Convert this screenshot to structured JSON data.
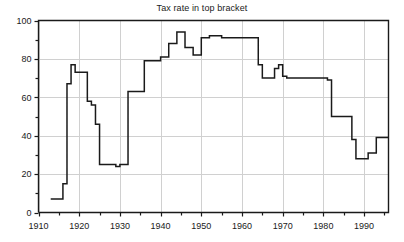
{
  "chart": {
    "title": "Tax rate in top bracket",
    "line_color": "#1a1a1a",
    "grid_color": "#d0d0d0",
    "axis_color": "#1a1a1a",
    "background": "#ffffff"
  },
  "chart_data": {
    "type": "line",
    "title": "Tax rate in top bracket",
    "xlabel": "",
    "ylabel": "",
    "xlim": [
      1910,
      1996
    ],
    "ylim": [
      0,
      100
    ],
    "grid": true,
    "legend": "none",
    "step_style": "post",
    "x_major_ticks": [
      1910,
      1920,
      1930,
      1940,
      1950,
      1960,
      1970,
      1980,
      1990
    ],
    "x_tick_labels": [
      "1910",
      "1920",
      "1930",
      "1940",
      "1950",
      "1960",
      "1970",
      "1980",
      "1990"
    ],
    "x_minor_ticks": [
      1915,
      1925,
      1935,
      1945,
      1955,
      1965,
      1975,
      1985,
      1995
    ],
    "y_major_ticks": [
      0,
      20,
      40,
      60,
      80,
      100
    ],
    "y_tick_labels": [
      "0",
      "20",
      "40",
      "60",
      "80",
      "100"
    ],
    "y_minor_ticks": [
      10,
      30,
      50,
      70,
      90
    ],
    "x": [
      1913,
      1914,
      1915,
      1916,
      1917,
      1918,
      1919,
      1920,
      1921,
      1922,
      1923,
      1924,
      1925,
      1926,
      1927,
      1928,
      1929,
      1930,
      1931,
      1932,
      1933,
      1934,
      1935,
      1936,
      1937,
      1938,
      1939,
      1940,
      1941,
      1942,
      1943,
      1944,
      1945,
      1946,
      1947,
      1948,
      1949,
      1950,
      1951,
      1952,
      1953,
      1954,
      1955,
      1956,
      1957,
      1958,
      1959,
      1960,
      1961,
      1962,
      1963,
      1964,
      1965,
      1966,
      1967,
      1968,
      1969,
      1970,
      1971,
      1972,
      1973,
      1974,
      1975,
      1976,
      1977,
      1978,
      1979,
      1980,
      1981,
      1982,
      1983,
      1984,
      1985,
      1986,
      1987,
      1988,
      1989,
      1990,
      1991,
      1992,
      1993,
      1994,
      1995,
      1996
    ],
    "y": [
      7,
      7,
      7,
      15,
      67,
      77,
      73,
      73,
      73,
      58,
      56,
      46,
      25,
      25,
      25,
      25,
      24,
      25,
      25,
      63,
      63,
      63,
      63,
      79,
      79,
      79,
      79,
      81,
      81,
      88,
      88,
      94,
      94,
      86,
      86,
      82,
      82,
      91,
      91,
      92,
      92,
      92,
      91,
      91,
      91,
      91,
      91,
      91,
      91,
      91,
      91,
      77,
      70,
      70,
      70,
      75,
      77,
      71,
      70,
      70,
      70,
      70,
      70,
      70,
      70,
      70,
      70,
      70,
      69,
      50,
      50,
      50,
      50,
      50,
      38,
      28,
      28,
      28,
      31,
      31,
      39,
      39,
      39,
      39
    ],
    "series": [
      {
        "name": "Top marginal tax rate",
        "values": [
          7,
          7,
          7,
          15,
          67,
          77,
          73,
          73,
          73,
          58,
          56,
          46,
          25,
          25,
          25,
          25,
          24,
          25,
          25,
          63,
          63,
          63,
          63,
          79,
          79,
          79,
          79,
          81,
          81,
          88,
          88,
          94,
          94,
          86,
          86,
          82,
          82,
          91,
          91,
          92,
          92,
          92,
          91,
          91,
          91,
          91,
          91,
          91,
          91,
          91,
          91,
          77,
          70,
          70,
          70,
          75,
          77,
          71,
          70,
          70,
          70,
          70,
          70,
          70,
          70,
          70,
          70,
          70,
          69,
          50,
          50,
          50,
          50,
          50,
          38,
          28,
          28,
          28,
          31,
          31,
          39,
          39,
          39,
          39
        ]
      }
    ],
    "annotations": []
  }
}
